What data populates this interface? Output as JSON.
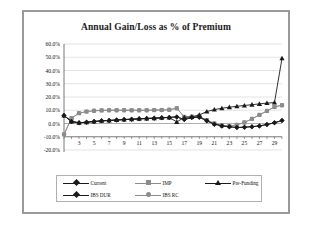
{
  "figure": {
    "title": "Annual Gain/Loss as % of Premium",
    "border_color": "#9a9a9a",
    "background": "#ffffff"
  },
  "legend": {
    "position": "bottom",
    "rows": [
      [
        {
          "label": "Current",
          "marker": "diamond",
          "color": "#1a1a1a"
        },
        {
          "label": "IMP",
          "marker": "square",
          "color": "#8c8c8c"
        },
        {
          "label": "Pre-Funding",
          "marker": "triangle",
          "color": "#1a1a1a"
        }
      ],
      [
        {
          "label": "IBS DUR",
          "marker": "diamond",
          "color": "#1a1a1a"
        },
        {
          "label": "IBS RC",
          "marker": "circle",
          "color": "#8c8c8c"
        }
      ]
    ]
  },
  "axes": {
    "y_ticks": [
      "60.0%",
      "50.0%",
      "40.0%",
      "30.0%",
      "20.0%",
      "10.0%",
      "0.0%",
      "-10.0%",
      "-20.0%"
    ],
    "x_ticks": [
      "3",
      "5",
      "7",
      "9",
      "11",
      "13",
      "15",
      "17",
      "19",
      "21",
      "23",
      "25",
      "27",
      "29"
    ]
  },
  "chart_data": {
    "type": "line",
    "title": "Annual Gain/Loss as % of Premium",
    "xlabel": "",
    "ylabel": "",
    "ylim": [
      -20,
      60
    ],
    "xlim": [
      1,
      30
    ],
    "ytick_step": 10,
    "grid": true,
    "grid_axis": "y",
    "legend_position": "bottom",
    "x": [
      1,
      2,
      3,
      4,
      5,
      6,
      7,
      8,
      9,
      10,
      11,
      12,
      13,
      14,
      15,
      16,
      17,
      18,
      19,
      20,
      21,
      22,
      23,
      24,
      25,
      26,
      27,
      28,
      29,
      30
    ],
    "series": [
      {
        "name": "Current",
        "marker": "diamond",
        "color": "#1a1a1a",
        "values": [
          6.0,
          1.5,
          0.5,
          1.0,
          1.5,
          2.0,
          2.3,
          2.6,
          3.0,
          3.2,
          3.5,
          3.8,
          4.0,
          4.3,
          4.6,
          5.0,
          3.0,
          4.5,
          4.8,
          2.0,
          -0.5,
          -1.8,
          -2.5,
          -3.0,
          -2.8,
          -2.4,
          -1.8,
          -0.8,
          0.6,
          2.2
        ]
      },
      {
        "name": "IMP",
        "marker": "square",
        "color": "#8c8c8c",
        "values": [
          -8.2,
          4.0,
          7.8,
          9.0,
          9.6,
          9.9,
          10.0,
          10.0,
          10.0,
          10.0,
          10.0,
          10.0,
          10.1,
          10.2,
          10.4,
          11.5,
          5.0,
          5.2,
          5.4,
          2.5,
          0.0,
          -1.5,
          -2.0,
          -1.0,
          0.8,
          3.5,
          6.5,
          9.5,
          12.5,
          13.8
        ]
      },
      {
        "name": "Pre-Funding",
        "marker": "triangle",
        "color": "#1a1a1a",
        "values": [
          6.0,
          1.5,
          0.5,
          1.0,
          1.5,
          2.0,
          2.3,
          2.6,
          3.0,
          3.2,
          3.5,
          3.8,
          4.0,
          4.3,
          4.6,
          1.2,
          4.6,
          5.0,
          6.5,
          9.0,
          10.5,
          11.5,
          12.3,
          13.0,
          13.6,
          14.2,
          14.8,
          15.4,
          15.8,
          49.2
        ]
      },
      {
        "name": "IBS DUR",
        "marker": "diamond",
        "color": "#1a1a1a",
        "values": [
          6.0,
          1.5,
          0.5,
          1.0,
          1.5,
          2.0,
          2.3,
          2.6,
          3.0,
          3.2,
          3.5,
          3.8,
          4.0,
          4.3,
          4.6,
          5.0,
          3.0,
          4.5,
          4.8,
          2.0,
          -0.5,
          -1.8,
          -2.5,
          -3.0,
          -2.8,
          -2.4,
          -1.8,
          -0.8,
          0.6,
          2.2
        ]
      },
      {
        "name": "IBS RC",
        "marker": "circle",
        "color": "#8c8c8c",
        "values": [
          -8.2,
          4.0,
          7.8,
          9.0,
          9.6,
          9.9,
          10.0,
          10.0,
          10.0,
          10.0,
          10.0,
          10.0,
          10.1,
          10.2,
          10.4,
          11.5,
          5.0,
          5.2,
          5.4,
          2.5,
          0.0,
          -1.5,
          -2.0,
          -1.0,
          0.8,
          3.5,
          6.5,
          9.5,
          12.5,
          13.8
        ]
      }
    ]
  }
}
